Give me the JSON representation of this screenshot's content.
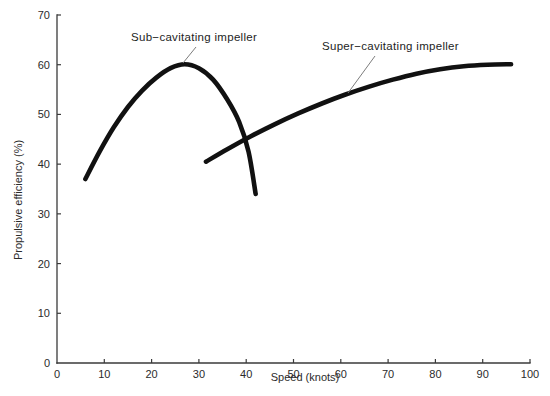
{
  "chart_data": {
    "type": "line",
    "title": "",
    "xlabel": "Speed (knots)",
    "ylabel": "Propulsive efficiency (%)",
    "xlim": [
      0,
      100
    ],
    "ylim": [
      0,
      70
    ],
    "xticks": [
      0,
      10,
      20,
      30,
      40,
      50,
      60,
      70,
      80,
      90,
      100
    ],
    "xtick_labels": [
      "0",
      "10",
      "20",
      "30",
      "40",
      "50",
      "60",
      "70",
      "80",
      "90",
      "100"
    ],
    "yticks": [
      0,
      10,
      20,
      30,
      40,
      50,
      60,
      70
    ],
    "ytick_labels": [
      "0",
      "10",
      "20",
      "30",
      "40",
      "50",
      "60",
      "70"
    ],
    "grid": false,
    "legend": "none",
    "series": [
      {
        "name": "Sub-cavitating impeller",
        "color": "#111111",
        "points": [
          [
            6.0,
            37.0
          ],
          [
            9.0,
            42.5
          ],
          [
            12.0,
            47.4
          ],
          [
            15.0,
            51.5
          ],
          [
            18.0,
            54.8
          ],
          [
            21.0,
            57.4
          ],
          [
            24.0,
            59.3
          ],
          [
            27.0,
            60.1
          ],
          [
            30.0,
            59.3
          ],
          [
            33.0,
            57.0
          ],
          [
            36.0,
            53.0
          ],
          [
            38.5,
            48.5
          ],
          [
            40.5,
            42.5
          ],
          [
            42.0,
            34.0
          ]
        ]
      },
      {
        "name": "Super-cavitating impeller",
        "color": "#111111",
        "points": [
          [
            31.5,
            40.5
          ],
          [
            36.0,
            43.0
          ],
          [
            41.0,
            45.6
          ],
          [
            46.0,
            48.0
          ],
          [
            51.0,
            50.2
          ],
          [
            56.0,
            52.2
          ],
          [
            61.0,
            54.0
          ],
          [
            66.0,
            55.6
          ],
          [
            71.0,
            57.0
          ],
          [
            76.0,
            58.2
          ],
          [
            81.0,
            59.1
          ],
          [
            86.0,
            59.7
          ],
          [
            91.0,
            60.0
          ],
          [
            96.0,
            60.1
          ]
        ]
      }
    ],
    "annotations": [
      {
        "text": "Sub−cavitating impeller",
        "text_x": 131,
        "text_y": 41,
        "leader": [
          [
            196,
            47
          ],
          [
            183,
            63
          ]
        ]
      },
      {
        "text": "Super−cavitating impeller",
        "text_x": 322,
        "text_y": 50,
        "leader": [
          [
            375,
            56
          ],
          [
            348,
            93
          ]
        ]
      }
    ]
  },
  "axes": {
    "x_axis_name": "speed-axis",
    "y_axis_name": "efficiency-axis"
  }
}
